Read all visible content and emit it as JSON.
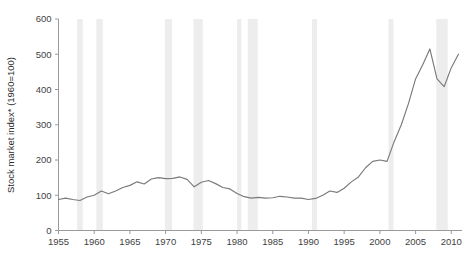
{
  "chart_data": {
    "type": "line",
    "title": "",
    "subtitle": "",
    "xlabel": "",
    "ylabel": "Stock market index* (1960=100)",
    "xlim": [
      1955,
      2011.5
    ],
    "ylim": [
      0,
      600
    ],
    "grid": false,
    "legend": "none",
    "line_color": "#7a7a7a",
    "band_color": "#ededed",
    "axis_color": "#9a9a9a",
    "text_color": "#3f3f3f",
    "x_ticks": [
      1955,
      1960,
      1965,
      1970,
      1975,
      1980,
      1985,
      1990,
      1995,
      2000,
      2005,
      2010
    ],
    "x_tick_labels": [
      "1955",
      "1960",
      "1965",
      "1970",
      "1975",
      "1980",
      "1985",
      "1990",
      "1995",
      "2000",
      "2005",
      "2010"
    ],
    "y_ticks": [
      0,
      100,
      200,
      300,
      400,
      500,
      600
    ],
    "y_tick_labels": [
      "0",
      "100",
      "200",
      "300",
      "400",
      "500",
      "600"
    ],
    "series": [
      {
        "name": "Stock market index",
        "x": [
          1955,
          1956,
          1957,
          1958,
          1959,
          1960,
          1961,
          1962,
          1963,
          1964,
          1965,
          1966,
          1967,
          1968,
          1969,
          1970,
          1971,
          1972,
          1973,
          1974,
          1975,
          1976,
          1977,
          1978,
          1979,
          1980,
          1981,
          1982,
          1983,
          1984,
          1985,
          1986,
          1987,
          1988,
          1989,
          1990,
          1991,
          1992,
          1993,
          1994,
          1995,
          1996,
          1997,
          1998,
          1999,
          2000,
          2001,
          2002,
          2003,
          2004,
          2005,
          2006,
          2007,
          2008,
          2009,
          2010,
          2011
        ],
        "values": [
          88,
          92,
          88,
          85,
          95,
          100,
          112,
          104,
          112,
          122,
          128,
          138,
          132,
          146,
          150,
          147,
          148,
          152,
          145,
          124,
          137,
          142,
          133,
          122,
          118,
          105,
          96,
          92,
          94,
          92,
          93,
          97,
          95,
          92,
          92,
          88,
          91,
          100,
          112,
          108,
          120,
          138,
          152,
          178,
          196,
          200,
          196,
          252,
          300,
          360,
          430,
          470,
          515,
          430,
          408,
          462,
          500
        ]
      }
    ],
    "recession_bands": [
      {
        "start": 1957.6,
        "end": 1958.4
      },
      {
        "start": 1960.3,
        "end": 1961.2
      },
      {
        "start": 1969.9,
        "end": 1970.9
      },
      {
        "start": 1973.9,
        "end": 1975.2
      },
      {
        "start": 1980.0,
        "end": 1980.6
      },
      {
        "start": 1981.5,
        "end": 1982.9
      },
      {
        "start": 1990.5,
        "end": 1991.2
      },
      {
        "start": 2001.2,
        "end": 2001.9
      },
      {
        "start": 2007.9,
        "end": 2009.5
      }
    ]
  }
}
